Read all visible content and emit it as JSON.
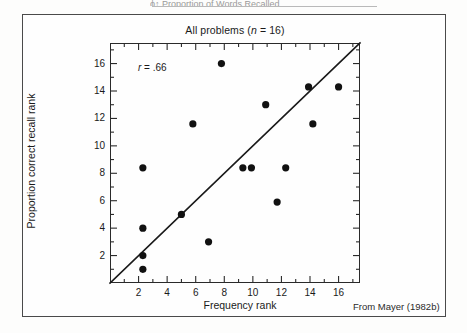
{
  "page": {
    "top_bleed_text": "ϕ↑   Proportion of Words Recalled",
    "source_credit": "From Mayer (1982b)"
  },
  "chart_data": {
    "type": "scatter",
    "title": "All problems (n = 16)",
    "title_parts": {
      "prefix": "All problems (",
      "italic": "n",
      "suffix": " = 16)"
    },
    "xlabel": "Frequency rank",
    "ylabel": "Proportion correct recall rank",
    "xlim": [
      0,
      17.5
    ],
    "ylim": [
      0,
      17.5
    ],
    "xticks_major": [
      2,
      4,
      6,
      8,
      10,
      12,
      14,
      16
    ],
    "yticks_major": [
      2,
      4,
      6,
      8,
      10,
      12,
      14,
      16
    ],
    "xticks_minor": [
      1,
      3,
      5,
      7,
      9,
      11,
      13,
      15,
      17
    ],
    "yticks_minor": [
      1,
      3,
      5,
      7,
      9,
      11,
      13,
      15,
      17
    ],
    "grid": false,
    "legend": "none",
    "annotation": {
      "label_italic": "r",
      "label_rest": " = .66",
      "value": 0.66
    },
    "n": 16,
    "marker": {
      "shape": "circle",
      "color": "#111111",
      "size_px": 3.6
    },
    "points": [
      {
        "x": 2.3,
        "y": 8.4
      },
      {
        "x": 2.3,
        "y": 4.0
      },
      {
        "x": 2.3,
        "y": 2.0
      },
      {
        "x": 2.3,
        "y": 1.0
      },
      {
        "x": 5.0,
        "y": 5.0
      },
      {
        "x": 5.8,
        "y": 11.6
      },
      {
        "x": 6.9,
        "y": 3.0
      },
      {
        "x": 7.8,
        "y": 16.0
      },
      {
        "x": 9.3,
        "y": 8.4
      },
      {
        "x": 9.9,
        "y": 8.4
      },
      {
        "x": 10.9,
        "y": 13.0
      },
      {
        "x": 11.7,
        "y": 5.9
      },
      {
        "x": 12.3,
        "y": 8.4
      },
      {
        "x": 13.9,
        "y": 14.3
      },
      {
        "x": 14.2,
        "y": 11.6
      },
      {
        "x": 16.0,
        "y": 14.3
      }
    ],
    "fit_line": {
      "kind": "regression",
      "x_start": 0.0,
      "y_start": 0.0,
      "x_end": 17.5,
      "y_end": 17.5,
      "color": "#1a1a1a",
      "width_px": 1.6
    }
  }
}
